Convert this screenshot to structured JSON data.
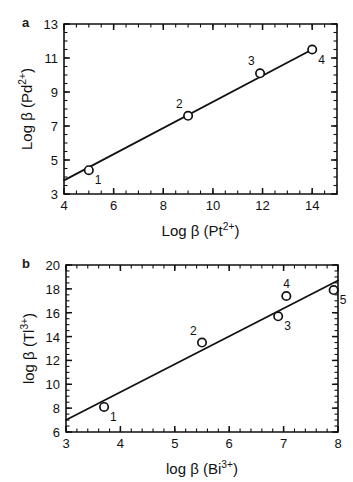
{
  "figure": {
    "panels": [
      {
        "id": "a",
        "label": "a",
        "xlabel_main": "Log β (Pt",
        "xlabel_sup": "2+",
        "xlabel_tail": ")",
        "ylabel_main": "Log β (Pd",
        "ylabel_sup": "2+",
        "ylabel_tail": ")",
        "xticks": [
          "4",
          "6",
          "8",
          "10",
          "12",
          "14"
        ],
        "yticks": [
          "3",
          "5",
          "7",
          "9",
          "11",
          "13"
        ],
        "point_labels": [
          "1",
          "2",
          "3",
          "4"
        ]
      },
      {
        "id": "b",
        "label": "b",
        "xlabel_main": "log β (Bi",
        "xlabel_sup": "3+",
        "xlabel_tail": ")",
        "ylabel_main": "log β (Tl",
        "ylabel_sup": "3+",
        "ylabel_tail": ")",
        "xticks": [
          "3",
          "4",
          "5",
          "6",
          "7",
          "8"
        ],
        "yticks": [
          "6",
          "8",
          "10",
          "12",
          "14",
          "16",
          "18",
          "20"
        ],
        "point_labels": [
          "1",
          "2",
          "3",
          "4",
          "5"
        ]
      }
    ]
  },
  "chart_data": [
    {
      "type": "scatter",
      "panel": "a",
      "title": "",
      "xlabel": "Log β (Pt2+)",
      "ylabel": "Log β (Pd2+)",
      "xlim": [
        4,
        15
      ],
      "ylim": [
        3,
        13
      ],
      "xticks": [
        4,
        6,
        8,
        10,
        12,
        14
      ],
      "yticks": [
        3,
        5,
        7,
        9,
        11,
        13
      ],
      "xtick_minor_step": 0.5,
      "ytick_minor_step": 0.5,
      "grid": false,
      "legend": false,
      "points": [
        {
          "label": "1",
          "x": 5.0,
          "y": 4.4,
          "label_pos": "below-right"
        },
        {
          "label": "2",
          "x": 9.0,
          "y": 7.6,
          "label_pos": "above-left"
        },
        {
          "label": "3",
          "x": 11.9,
          "y": 10.1,
          "label_pos": "above-left"
        },
        {
          "label": "4",
          "x": 14.0,
          "y": 11.5,
          "label_pos": "below-right"
        }
      ],
      "fit_line": {
        "x0": 4.0,
        "y0": 3.8,
        "x1": 14.0,
        "y1": 11.5
      }
    },
    {
      "type": "scatter",
      "panel": "b",
      "title": "",
      "xlabel": "log β (Bi3+)",
      "ylabel": "log β (Tl3+)",
      "xlim": [
        3,
        8
      ],
      "ylim": [
        6,
        20
      ],
      "xticks": [
        3,
        4,
        5,
        6,
        7,
        8
      ],
      "yticks": [
        6,
        8,
        10,
        12,
        14,
        16,
        18,
        20
      ],
      "xtick_minor_step": 0.2,
      "ytick_minor_step": 0.5,
      "grid": false,
      "legend": false,
      "points": [
        {
          "label": "1",
          "x": 3.7,
          "y": 8.1,
          "label_pos": "below-right"
        },
        {
          "label": "2",
          "x": 5.5,
          "y": 13.5,
          "label_pos": "above-left"
        },
        {
          "label": "3",
          "x": 6.9,
          "y": 15.7,
          "label_pos": "below-right"
        },
        {
          "label": "4",
          "x": 7.05,
          "y": 17.4,
          "label_pos": "above"
        },
        {
          "label": "5",
          "x": 7.92,
          "y": 17.9,
          "label_pos": "below-right"
        }
      ],
      "fit_line": {
        "x0": 3.0,
        "y0": 7.0,
        "x1": 8.0,
        "y1": 18.7
      }
    }
  ]
}
